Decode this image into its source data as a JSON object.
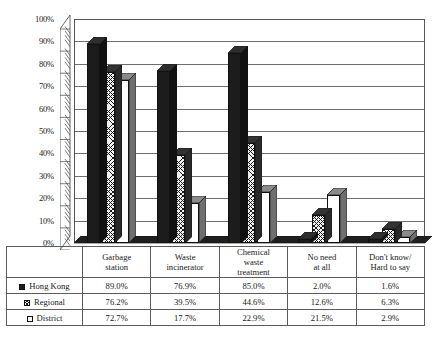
{
  "chart_data": {
    "type": "bar",
    "title": "",
    "xlabel": "",
    "ylabel": "",
    "ylim": [
      0,
      100
    ],
    "ytick_labels": [
      "0%",
      "10%",
      "20%",
      "30%",
      "40%",
      "50%",
      "60%",
      "70%",
      "80%",
      "90%",
      "100%"
    ],
    "ytick_values": [
      0,
      10,
      20,
      30,
      40,
      50,
      60,
      70,
      80,
      90,
      100
    ],
    "grid": "horizontal",
    "legend_position": "table-left-column",
    "categories": [
      "Garbage station",
      "Waste incinerator",
      "Chemical waste treatment",
      "No need at all",
      "Don't know/ Hard to say"
    ],
    "category_lines": [
      [
        "Garbage",
        "station"
      ],
      [
        "Waste",
        "incinerator"
      ],
      [
        "Chemical",
        "waste",
        "treatment"
      ],
      [
        "No need",
        "at all"
      ],
      [
        "Don't know/",
        "Hard to say"
      ]
    ],
    "series": [
      {
        "name": "Hong Kong",
        "pattern": "solid-black",
        "values": [
          89.0,
          76.9,
          85.0,
          2.0,
          1.6
        ],
        "labels": [
          "89.0%",
          "76.9%",
          "85.0%",
          "2.0%",
          "1.6%"
        ]
      },
      {
        "name": "Regional",
        "pattern": "crosshatch",
        "values": [
          76.2,
          39.5,
          44.6,
          12.6,
          6.3
        ],
        "labels": [
          "76.2%",
          "39.5%",
          "44.6%",
          "12.6%",
          "6.3%"
        ]
      },
      {
        "name": "District",
        "pattern": "white",
        "values": [
          72.7,
          17.7,
          22.9,
          21.5,
          2.9
        ],
        "labels": [
          "72.7%",
          "17.7%",
          "22.9%",
          "21.5%",
          "2.9%"
        ]
      }
    ]
  },
  "colors": {
    "series_hong_kong": "#1c1c1c",
    "series_regional": "#ededed",
    "series_district": "#ffffff",
    "gridline": "#6d6d6d",
    "axis": "#555555",
    "table_border": "#5c5c5c",
    "background": "#ffffff"
  }
}
